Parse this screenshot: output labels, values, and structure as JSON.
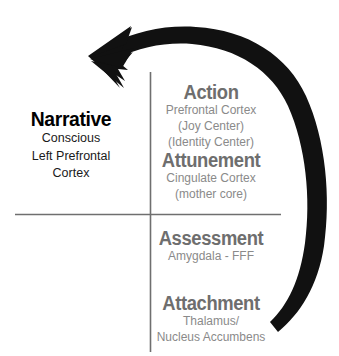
{
  "diagram": {
    "colors": {
      "background": "#ffffff",
      "axis_line": "#6f6f6f",
      "arrow": "#111111",
      "left_heading": "#000000",
      "left_subtitle": "#1a1a1a",
      "right_heading": "#6e6e6e",
      "right_subtitle": "#8a8a8a"
    },
    "axes": {
      "horizontal_label": "horizontal-divider",
      "vertical_label": "vertical-divider"
    },
    "arrow": {
      "name": "curved-feedback-arrow",
      "direction": "clockwise-from-bottom-right-to-upper-left",
      "head_position": "upper-left"
    },
    "quadrants": [
      {
        "id": "narrative",
        "heading": "Narrative",
        "subtitle_lines": [
          "Conscious",
          "Left Prefrontal",
          "Cortex"
        ]
      },
      {
        "id": "action",
        "heading": "Action",
        "subtitle_lines": [
          "Prefrontal Cortex",
          "(Joy Center)",
          "(Identity Center)"
        ]
      },
      {
        "id": "attunement",
        "heading": "Attunement",
        "subtitle_lines": [
          "Cingulate Cortex",
          "(mother core)"
        ]
      },
      {
        "id": "assessment",
        "heading": "Assessment",
        "subtitle_lines": [
          "Amygdala - FFF"
        ]
      },
      {
        "id": "attachment",
        "heading": "Attachment",
        "subtitle_lines": [
          "Thalamus/",
          "Nucleus Accumbens"
        ]
      }
    ]
  }
}
